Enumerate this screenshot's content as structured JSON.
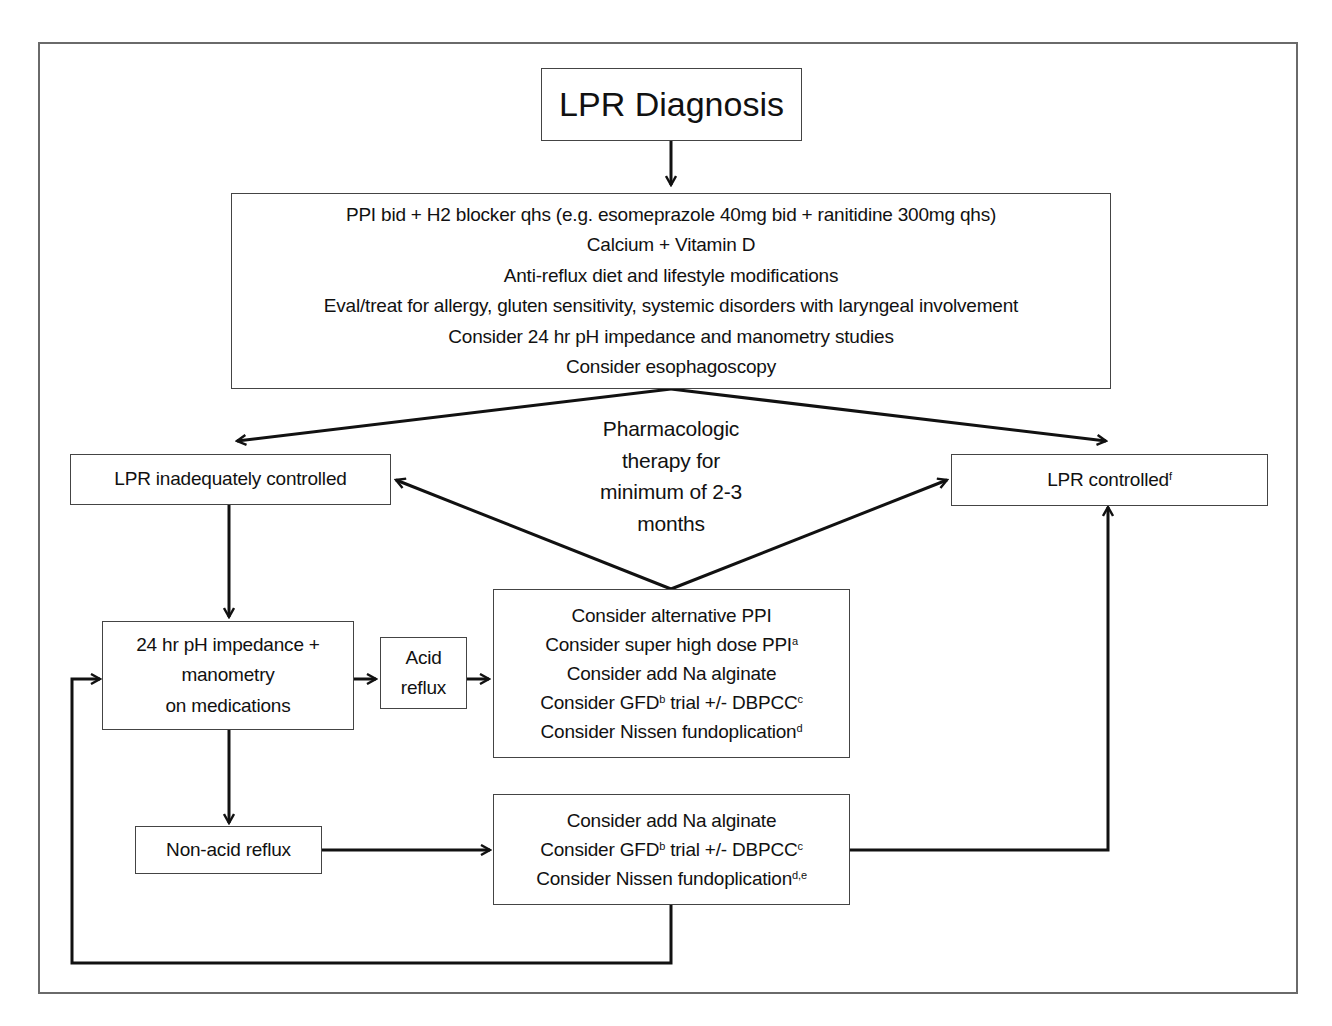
{
  "diagram": {
    "title": "LPR Diagnosis",
    "initial_treatment": {
      "lines": [
        "PPI bid + H2 blocker qhs (e.g. esomeprazole 40mg bid + ranitidine 300mg qhs)",
        "Calcium + Vitamin D",
        "Anti-reflux diet and lifestyle modifications",
        "Eval/treat for allergy, gluten sensitivity, systemic disorders with laryngeal involvement",
        "Consider 24 hr pH impedance and manometry studies",
        "Consider esophagoscopy"
      ]
    },
    "therapy_note": {
      "lines": [
        "Pharmacologic",
        "therapy for",
        "minimum of 2-3",
        "months"
      ]
    },
    "inadequately_controlled": {
      "label": "LPR inadequately controlled"
    },
    "controlled": {
      "label": "LPR controlled",
      "sup": "f"
    },
    "impedance_test": {
      "lines": [
        "24 hr pH impedance +",
        "manometry",
        "on medications"
      ]
    },
    "acid_reflux": {
      "lines": [
        "Acid",
        "reflux"
      ]
    },
    "acid_options": {
      "lines": [
        {
          "text": "Consider alternative PPI",
          "sup": ""
        },
        {
          "text": "Consider super high dose PPI",
          "sup": "a"
        },
        {
          "text": "Consider add Na alginate",
          "sup": ""
        },
        {
          "text": "Consider GFD",
          "sup": "b",
          "tail": " trial +/- DBPCC",
          "tail_sup": "c"
        },
        {
          "text": "Consider Nissen fundoplication",
          "sup": "d"
        }
      ]
    },
    "non_acid_reflux": {
      "label": "Non-acid reflux"
    },
    "non_acid_options": {
      "lines": [
        {
          "text": "Consider add Na alginate",
          "sup": ""
        },
        {
          "text": "Consider GFD",
          "sup": "b",
          "tail": " trial +/- DBPCC",
          "tail_sup": "c"
        },
        {
          "text": "Consider Nissen fundoplication",
          "sup": "d,e"
        }
      ]
    },
    "colors": {
      "frame": "#6a6a6a",
      "box_border": "#444444",
      "arrow": "#111111",
      "text": "#111111"
    }
  }
}
